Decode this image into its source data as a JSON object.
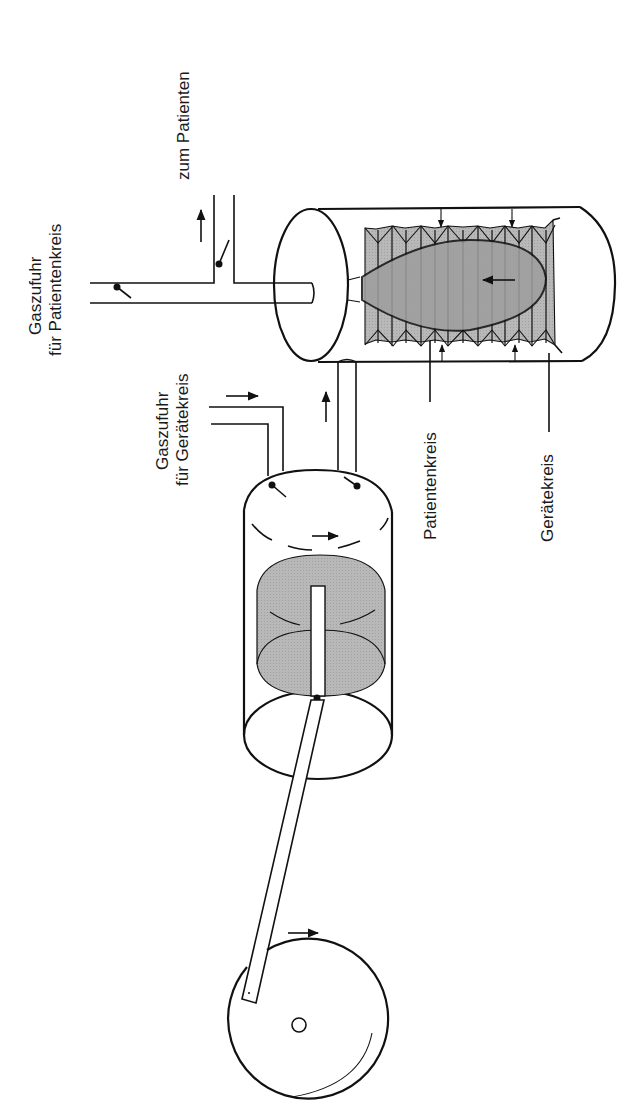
{
  "diagram": {
    "orientation": "rotated 90 degrees counter-clockwise",
    "labels": {
      "to_patient": "zum Patienten",
      "patient_gas_supply_line1": "Gaszufuhr",
      "patient_gas_supply_line2": "für Patientenkreis",
      "device_gas_supply_line1": "Gaszufuhr",
      "device_gas_supply_line2": "für Gerätekreis",
      "patient_circuit": "Patientenkreis",
      "device_circuit": "Gerätekreis"
    },
    "components": [
      {
        "id": "crank-wheel",
        "label": "Antriebsrad"
      },
      {
        "id": "connecting-rod",
        "label": "Pleuelstange"
      },
      {
        "id": "piston-cylinder",
        "label": "Kolbenzylinder"
      },
      {
        "id": "piston",
        "label": "Kolben"
      },
      {
        "id": "bellows-chamber",
        "label": "Balgkammer"
      },
      {
        "id": "bellows",
        "label": "Balg"
      },
      {
        "id": "patient-gas-inlet",
        "label": "Gaszufuhr für Patientenkreis"
      },
      {
        "id": "device-gas-inlet",
        "label": "Gaszufuhr für Gerätekreis"
      },
      {
        "id": "patient-outlet",
        "label": "zum Patienten"
      }
    ],
    "colors": {
      "line": "#111111",
      "fill_grey": "#bdbdbd",
      "fill_grey_dark": "#9e9e9e",
      "background": "#ffffff"
    }
  }
}
